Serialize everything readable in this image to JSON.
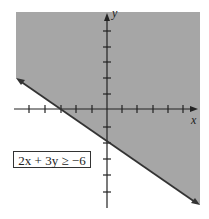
{
  "diagram": {
    "type": "inequality-graph",
    "inequality": "2x + 3y ≥ −6",
    "boundary_line": "2x + 3y = −6",
    "x_intercept": -3,
    "y_intercept": -2,
    "shaded_side": "above",
    "x_axis_label": "x",
    "y_axis_label": "y",
    "x_range": [
      -6,
      5
    ],
    "y_range": [
      -6,
      5
    ],
    "tick_spacing": 1,
    "colors": {
      "shade": "#a6a6a6",
      "axis": "#222222",
      "boundary": "#333333",
      "background": "#ffffff"
    }
  }
}
